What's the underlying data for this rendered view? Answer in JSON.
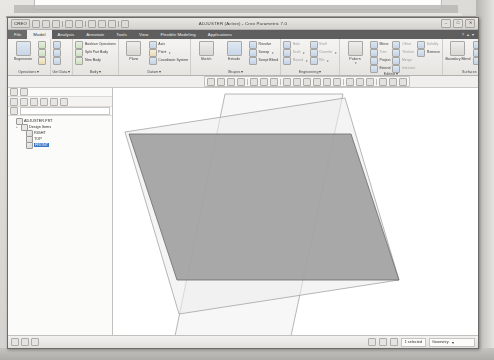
{
  "window": {
    "title": "ADJUSTER (Active) - Creo Parametric 7.0",
    "logo": "CREO",
    "buttons": {
      "minimize": "–",
      "maximize": "□",
      "close": "✕"
    }
  },
  "quick_access": {
    "items": [
      "new-icon",
      "open-icon",
      "save-icon",
      "undo-icon",
      "redo-icon",
      "regenerate-icon",
      "window-icon",
      "close-icon"
    ]
  },
  "tabs": [
    {
      "label": "File",
      "state": "file"
    },
    {
      "label": "Model",
      "state": "active"
    },
    {
      "label": "Analysis",
      "state": "normal"
    },
    {
      "label": "Annotate",
      "state": "normal"
    },
    {
      "label": "Tools",
      "state": "normal"
    },
    {
      "label": "View",
      "state": "normal"
    },
    {
      "label": "Flexible Modeling",
      "state": "normal"
    },
    {
      "label": "Applications",
      "state": "normal"
    }
  ],
  "tab_right": {
    "help": "?",
    "minimize_ribbon": "▴",
    "options": "▾"
  },
  "ribbon": {
    "groups": [
      {
        "label": "Operations",
        "big": [
          {
            "label": "Regenerate",
            "icon": "regenerate-icon",
            "style": "blue"
          }
        ],
        "small": [
          {
            "label": "",
            "icon": "copy-icon",
            "style": "g",
            "dim": true
          },
          {
            "label": "",
            "icon": "paste-icon",
            "style": "g",
            "dim": true
          },
          {
            "label": "",
            "icon": "delete-icon",
            "style": "y",
            "dim": true
          }
        ]
      },
      {
        "label": "Get Data",
        "big": [],
        "small": [
          {
            "label": "",
            "icon": "user-defined-feature-icon",
            "style": "b"
          },
          {
            "label": "",
            "icon": "copy-geometry-icon",
            "style": "b"
          },
          {
            "label": "",
            "icon": "shrinkwrap-icon",
            "style": "b"
          }
        ]
      },
      {
        "label": "Body",
        "big": [],
        "small": [
          {
            "label": "Boolean Operations",
            "icon": "boolean-operations-icon",
            "style": "g"
          },
          {
            "label": "Split Part Body",
            "icon": "split-body-icon",
            "style": "g"
          },
          {
            "label": "New Body",
            "icon": "new-body-icon",
            "style": "g"
          }
        ]
      },
      {
        "label": "Datum",
        "big": [
          {
            "label": "Plane",
            "icon": "datum-plane-icon",
            "style": "grey"
          }
        ],
        "small": [
          {
            "label": "Axis",
            "icon": "datum-axis-icon",
            "style": "b"
          },
          {
            "label": "Point",
            "icon": "datum-point-icon",
            "style": "y",
            "caret": true
          },
          {
            "label": "Coordinate System",
            "icon": "coordinate-system-icon",
            "style": "b"
          }
        ]
      },
      {
        "label": "Shapes",
        "big": [
          {
            "label": "Sketch",
            "icon": "sketch-icon",
            "style": "grey"
          },
          {
            "label": "Extrude",
            "icon": "extrude-icon",
            "style": "blue"
          }
        ],
        "small": [
          {
            "label": "Revolve",
            "icon": "revolve-icon",
            "style": "b"
          },
          {
            "label": "Sweep",
            "icon": "sweep-icon",
            "style": "b",
            "caret": true
          },
          {
            "label": "Swept Blend",
            "icon": "swept-blend-icon",
            "style": "b"
          }
        ]
      },
      {
        "label": "Engineering",
        "big": [],
        "small": [
          {
            "label": "Hole",
            "icon": "hole-icon",
            "style": "b",
            "dim": true
          },
          {
            "label": "Draft",
            "icon": "draft-icon",
            "style": "b",
            "dim": true,
            "caret": true
          },
          {
            "label": "Round",
            "icon": "round-icon",
            "style": "b",
            "dim": true,
            "caret": true
          },
          {
            "label": "Shell",
            "icon": "shell-icon",
            "style": "b",
            "dim": true
          },
          {
            "label": "Chamfer",
            "icon": "chamfer-icon",
            "style": "b",
            "dim": true,
            "caret": true
          },
          {
            "label": "Rib",
            "icon": "rib-icon",
            "style": "b",
            "dim": true,
            "caret": true
          }
        ]
      },
      {
        "label": "Editing",
        "big": [
          {
            "label": "Pattern",
            "icon": "pattern-icon",
            "style": "grey",
            "caret": true
          }
        ],
        "small": [
          {
            "label": "Mirror",
            "icon": "mirror-icon",
            "style": "b"
          },
          {
            "label": "Trim",
            "icon": "trim-icon",
            "style": "b",
            "dim": true
          },
          {
            "label": "Project",
            "icon": "project-icon",
            "style": "b"
          },
          {
            "label": "Extend",
            "icon": "extend-icon",
            "style": "b"
          },
          {
            "label": "Offset",
            "icon": "offset-icon",
            "style": "b",
            "dim": true
          },
          {
            "label": "Thicken",
            "icon": "thicken-icon",
            "style": "b",
            "dim": true
          },
          {
            "label": "Merge",
            "icon": "merge-icon",
            "style": "b",
            "dim": true
          },
          {
            "label": "Intersect",
            "icon": "intersect-icon",
            "style": "b",
            "dim": true
          },
          {
            "label": "Solidify",
            "icon": "solidify-icon",
            "style": "b",
            "dim": true
          },
          {
            "label": "Remove",
            "icon": "remove-surface-icon",
            "style": "b"
          }
        ]
      },
      {
        "label": "Surfaces",
        "big": [
          {
            "label": "Boundary Blend",
            "icon": "boundary-blend-icon",
            "style": "grey"
          }
        ],
        "small": [
          {
            "label": "Fill",
            "icon": "fill-icon",
            "style": "b"
          },
          {
            "label": "Style",
            "icon": "style-icon",
            "style": "b"
          },
          {
            "label": "Freestyle",
            "icon": "freestyle-icon",
            "style": "b"
          }
        ]
      },
      {
        "label": "Model Intent",
        "big": [
          {
            "label": "Component Interface",
            "icon": "component-interface-icon",
            "style": "grey"
          }
        ],
        "small": []
      }
    ]
  },
  "graphics_toolbar": {
    "icons": [
      "repaint-icon",
      "zoom-in-icon",
      "zoom-out-icon",
      "refit-icon",
      "orientation-icon",
      "saved-views-icon",
      "view-manager-icon",
      "datum-display-icon",
      "plane-display-icon",
      "axis-display-icon",
      "point-display-icon",
      "csys-display-icon",
      "annotation-display-icon",
      "spin-center-icon",
      "display-style-icon",
      "perspective-icon",
      "appearance-icon",
      "layer-icon",
      "drag-icon"
    ]
  },
  "model_tree": {
    "toolbar_icons": [
      "show-icon",
      "settings-icon",
      "filter-icon",
      "expand-icon",
      "collapse-icon",
      "search-icon"
    ],
    "filter_placeholder": "",
    "nodes": [
      {
        "label": "ADJUSTER.PRT",
        "icon": "part-icon",
        "indent": 0,
        "expander": "",
        "selected": false
      },
      {
        "label": "Design Items",
        "icon": "folder-icon",
        "indent": 1,
        "expander": "+",
        "selected": false
      },
      {
        "label": "RIGHT",
        "icon": "datum-plane-icon",
        "indent": 2,
        "expander": "",
        "selected": false
      },
      {
        "label": "TOP",
        "icon": "datum-plane-icon",
        "indent": 2,
        "expander": "",
        "selected": false
      },
      {
        "label": "FRONT",
        "icon": "datum-plane-icon",
        "indent": 2,
        "expander": "",
        "selected": true
      }
    ]
  },
  "canvas": {
    "datum_planes": [
      {
        "name": "RIGHT",
        "fill": "#f0f0f0",
        "stroke": "#8e8e8e",
        "opacity": 0.55
      },
      {
        "name": "TOP",
        "fill": "#e8e8e8",
        "stroke": "#8e8e8e",
        "opacity": 0.55
      },
      {
        "name": "FRONT",
        "fill": "#9a9a9a",
        "stroke": "#6e6e6e",
        "opacity": 0.85
      }
    ],
    "background": "#ffffff"
  },
  "status_bar": {
    "left_icons": [
      "message-log-icon",
      "model-tree-icon",
      "browser-icon"
    ],
    "right_icons": [
      "selection-filter-icon",
      "clipboard-icon",
      "shortcut-icon"
    ],
    "selected_text": "1 selected",
    "filter_value": "Geometry",
    "filter_caret": "▾"
  }
}
